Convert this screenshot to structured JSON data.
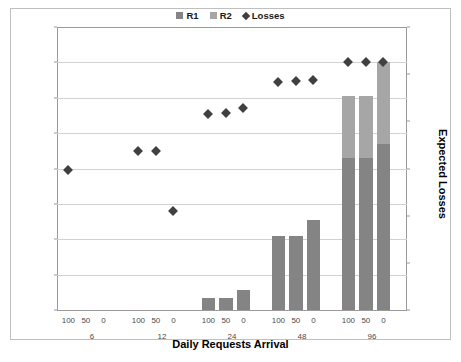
{
  "chart_data": {
    "type": "bar",
    "title": "",
    "xlabel": "Daily Requests Arrival",
    "ylabel": "Refused Requests per Month",
    "y2label": "Expected Losses",
    "ylim": [
      0,
      800
    ],
    "yticks": [
      0,
      100,
      200,
      300,
      400,
      500,
      600,
      700,
      800
    ],
    "y2_scale": "log",
    "y2ticks": [
      "€ 1",
      "€ 10",
      "€ 100",
      "€ 1,000",
      "€ 10,000",
      "€ 100,000",
      "€ 1,000,000"
    ],
    "grid": true,
    "legend_position": "top-center",
    "legend": [
      "R1",
      "R2",
      "Losses"
    ],
    "group_labels": [
      "6",
      "12",
      "24",
      "48",
      "96"
    ],
    "sub_labels": [
      "100",
      "50",
      "0"
    ],
    "categories": [
      "6 / 100",
      "6 / 50",
      "6 / 0",
      "12 / 100",
      "12 / 50",
      "12 / 0",
      "24 / 100",
      "24 / 50",
      "24 / 0",
      "48 / 100",
      "48 / 50",
      "48 / 0",
      "96 / 100",
      "96 / 50",
      "96 / 0"
    ],
    "series": [
      {
        "name": "R1",
        "color": "#848484",
        "values": [
          0,
          0,
          0,
          0,
          0,
          0,
          35,
          35,
          57,
          210,
          210,
          255,
          430,
          430,
          470
        ]
      },
      {
        "name": "R2",
        "color": "#a6a6a6",
        "values": [
          0,
          0,
          0,
          0,
          0,
          0,
          0,
          0,
          0,
          0,
          0,
          0,
          175,
          175,
          230
        ]
      },
      {
        "name": "Losses",
        "color": "#404040",
        "marker": "diamond",
        "axis": "secondary",
        "values": [
          395,
          null,
          null,
          450,
          450,
          280,
          555,
          558,
          570,
          645,
          648,
          650,
          700,
          700,
          700
        ]
      }
    ]
  },
  "legend": {
    "items": [
      {
        "label": "R1",
        "marker": "square",
        "color": "#848484"
      },
      {
        "label": "R2",
        "marker": "square",
        "color": "#a6a6a6"
      },
      {
        "label": "Losses",
        "marker": "diamond",
        "color": "#404040"
      }
    ]
  },
  "axes": {
    "left_title": "Refused Requests per Month",
    "right_title": "Expected Losses",
    "bottom_title": "Daily Requests Arrival"
  }
}
